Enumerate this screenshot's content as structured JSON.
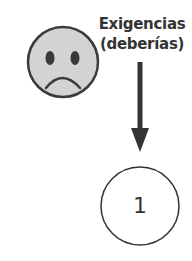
{
  "diagram": {
    "face": {
      "icon": "sad-face-icon",
      "fill": "#d3d3d3",
      "stroke": "#3a3a3a"
    },
    "label": {
      "line1": "Exigencias",
      "line2": "(deberías)"
    },
    "arrow": {
      "direction": "down",
      "color": "#333333"
    },
    "node": {
      "number": "1",
      "stroke": "#333333"
    }
  }
}
